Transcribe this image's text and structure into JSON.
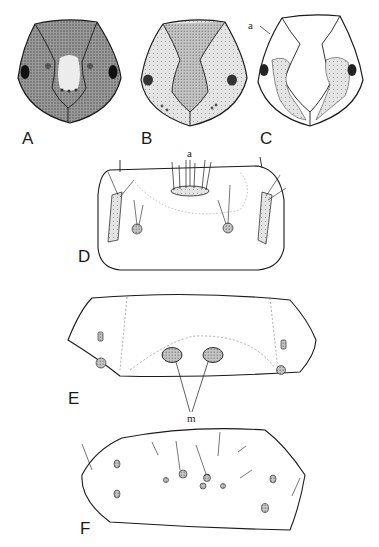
{
  "figure": {
    "panels": [
      {
        "id": "A",
        "label": "A",
        "subject": "head capsule, dark stippled frons"
      },
      {
        "id": "B",
        "label": "B",
        "subject": "head capsule, lighter stippled frons"
      },
      {
        "id": "C",
        "label": "C",
        "subject": "head capsule with patchy pigmentation",
        "annotation": "a"
      },
      {
        "id": "D",
        "label": "D",
        "subject": "pronotum with setae and sclerites",
        "annotation": "a"
      },
      {
        "id": "E",
        "label": "E",
        "subject": "segment with dotted outlines and muscle scars",
        "annotation": "m"
      },
      {
        "id": "F",
        "label": "F",
        "subject": "lateral segment with setae and pinacula"
      }
    ],
    "colors": {
      "ink": "#1a1a1a",
      "stipple": "#8a8a8a",
      "background": "#ffffff"
    }
  }
}
